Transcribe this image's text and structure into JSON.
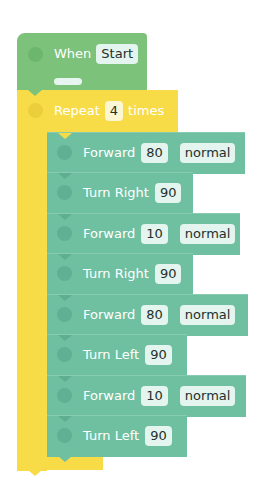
{
  "hat_block": {
    "label": "When",
    "trigger": "Start",
    "color": "#7cc27a"
  },
  "repeat_block": {
    "label": "Repeat",
    "count": "4",
    "suffix": "times",
    "color": "#f7dc48"
  },
  "colors": {
    "motion": "#6fbfa1",
    "event": "#7cc27a",
    "control": "#f7dc48"
  },
  "steps": [
    {
      "label": "Forward",
      "value": "80",
      "speed": "normal",
      "width": 198
    },
    {
      "label": "Turn Right",
      "value": "90",
      "width": 146
    },
    {
      "label": "Forward",
      "value": "10",
      "speed": "normal",
      "width": 193
    },
    {
      "label": "Turn Right",
      "value": "90",
      "width": 146
    },
    {
      "label": "Forward",
      "value": "80",
      "speed": "normal",
      "width": 201
    },
    {
      "label": "Turn Left",
      "value": "90",
      "width": 140
    },
    {
      "label": "Forward",
      "value": "10",
      "speed": "normal",
      "width": 199
    },
    {
      "label": "Turn Left",
      "value": "90",
      "width": 140
    }
  ]
}
